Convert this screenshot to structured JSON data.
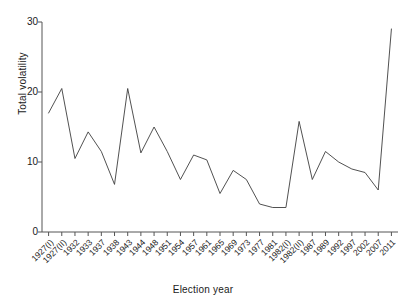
{
  "chart_data": {
    "type": "line",
    "title": "",
    "xlabel": "Election year",
    "ylabel": "Total volatility",
    "ylim": [
      0,
      30
    ],
    "yticks": [
      0,
      10,
      20,
      30
    ],
    "grid": false,
    "legend": false,
    "legend_position": "none",
    "line_color": "#3d3d3d",
    "categories": [
      "1927(I)",
      "1927(II)",
      "1932",
      "1933",
      "1937",
      "1938",
      "1943",
      "1944",
      "1948",
      "1951",
      "1954",
      "1957",
      "1961",
      "1965",
      "1969",
      "1973",
      "1977",
      "1981",
      "1982(I)",
      "1982(II)",
      "1987",
      "1989",
      "1992",
      "1997",
      "2002",
      "2007",
      "2011"
    ],
    "values": [
      17.0,
      20.5,
      10.5,
      14.3,
      11.5,
      6.8,
      20.5,
      11.3,
      15.0,
      11.5,
      7.5,
      11.0,
      10.3,
      5.5,
      8.8,
      7.5,
      4.0,
      3.5,
      3.5,
      15.8,
      7.5,
      11.5,
      10.0,
      9.0,
      8.5,
      6.0,
      29.0
    ]
  }
}
